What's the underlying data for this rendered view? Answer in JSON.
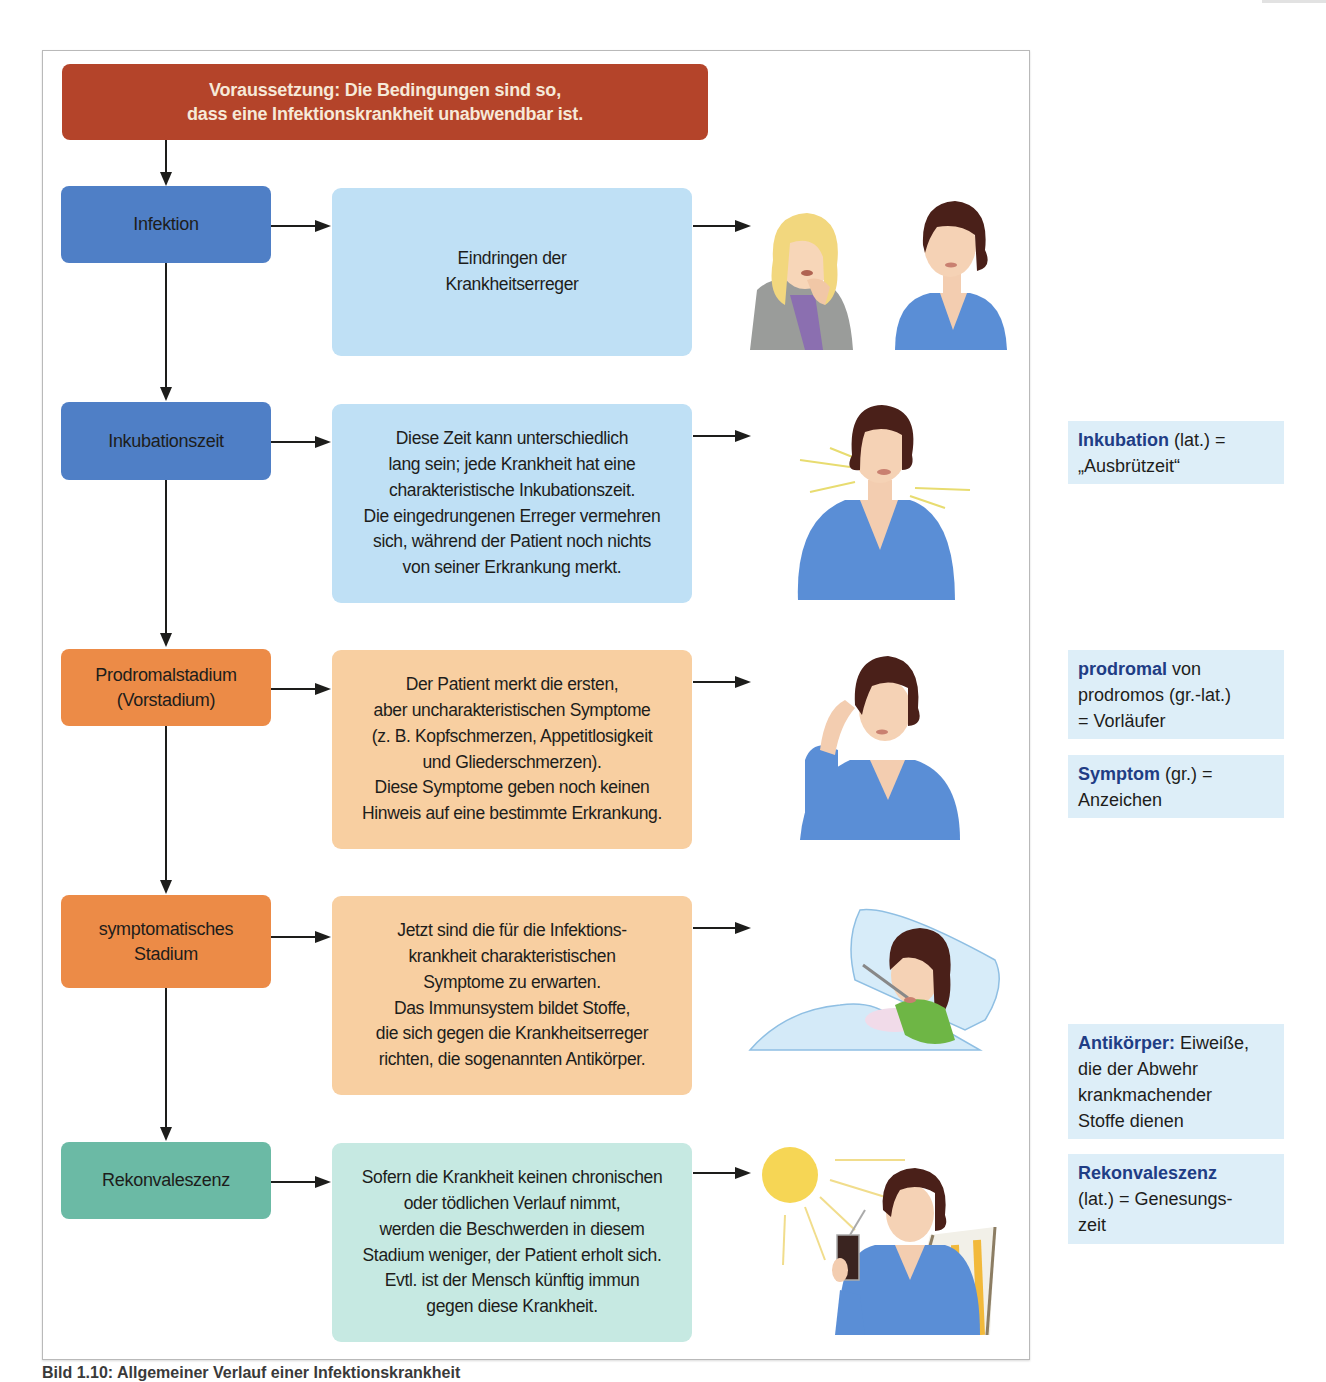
{
  "header": {
    "line1": "Voraussetzung: Die Bedingungen sind so,",
    "line2": "dass eine Infektionskrankheit unabwendbar ist."
  },
  "stages": [
    {
      "title_lines": [
        "Infektion"
      ],
      "description_lines": [
        "Eindringen der",
        "Krankheitserreger"
      ],
      "illustration": "coughing-woman-and-healthy-woman"
    },
    {
      "title_lines": [
        "Inkubationszeit"
      ],
      "description_lines": [
        "Diese Zeit kann unterschiedlich",
        "lang sein; jede Krankheit hat eine",
        "charakteristische Inkubationszeit.",
        "Die eingedrungenen Erreger vermehren",
        "sich, während der Patient noch nichts",
        "von seiner Erkrankung merkt."
      ],
      "illustration": "woman-feeling-fine"
    },
    {
      "title_lines": [
        "Prodromalstadium",
        "(Vorstadium)"
      ],
      "description_lines": [
        "Der Patient merkt die ersten,",
        "aber uncharakteristischen Symptome",
        "(z. B. Kopfschmerzen, Appetitlosigkeit",
        "und Gliederschmerzen).",
        "Diese Symptome geben noch keinen",
        "Hinweis auf eine bestimmte Erkrankung."
      ],
      "illustration": "woman-with-headache"
    },
    {
      "title_lines": [
        "symptomatisches",
        "Stadium"
      ],
      "description_lines": [
        "Jetzt sind die für die Infektions-",
        "krankheit charakteristischen",
        "Symptome zu erwarten.",
        "Das Immunsystem bildet Stoffe,",
        "die sich gegen die Krankheitserreger",
        "richten, die sogenannten Antikörper."
      ],
      "illustration": "sick-woman-in-bed-with-thermometer"
    },
    {
      "title_lines": [
        "Rekonvaleszenz"
      ],
      "description_lines": [
        "Sofern die Krankheit keinen chronischen",
        "oder tödlichen Verlauf nimmt,",
        "werden die Beschwerden in diesem",
        "Stadium weniger, der Patient erholt sich.",
        "Evtl. ist der Mensch künftig immun",
        "gegen diese Krankheit."
      ],
      "illustration": "woman-relaxing-in-sun-with-drink"
    }
  ],
  "glossary": [
    {
      "term": "Inkubation",
      "rest_lines": [
        " (lat.) =",
        "„Ausbrützeit“"
      ]
    },
    {
      "term": "prodromal",
      "rest_lines": [
        " von",
        "prodromos (gr.-lat.)",
        "= Vorläufer"
      ]
    },
    {
      "term": "Symptom",
      "rest_lines": [
        " (gr.) =",
        "Anzeichen"
      ]
    },
    {
      "term": "Antikörper:",
      "rest_lines": [
        " Eiweiße,",
        "die der Abwehr",
        "krankmachender",
        "Stoffe dienen"
      ]
    },
    {
      "term": "Rekonvaleszenz",
      "rest_lines": [
        "",
        "(lat.) = Genesungs-",
        "zeit"
      ]
    }
  ],
  "caption": "Bild 1.10: Allgemeiner Verlauf einer Infektionskrankheit",
  "colors": {
    "header": "#b4442a",
    "blue_dark": "#4f7fc6",
    "blue_light": "#bfe0f5",
    "orange_dark": "#ec8b47",
    "orange_light": "#f8cfa1",
    "teal_dark": "#6bbaa5",
    "teal_light": "#c6e9e2",
    "glossary_bg": "#ddeef8",
    "glossary_term": "#1f3d85"
  }
}
